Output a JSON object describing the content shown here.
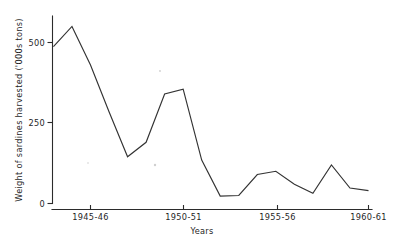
{
  "chart_data": {
    "type": "line",
    "title": "",
    "xlabel": "Years",
    "ylabel": "Weight of sardines harvested ('000s tons)",
    "xlim": [
      1943.0,
      1960.75
    ],
    "ylim": [
      0,
      580
    ],
    "yticks": [
      0,
      250,
      500
    ],
    "ytick_labels": [
      "0",
      "250",
      "500"
    ],
    "xticks": [
      1945,
      1950,
      1955,
      1960
    ],
    "xtick_labels": [
      "1945-46",
      "1950-51",
      "1955-56",
      "1960-61"
    ],
    "grid": false,
    "legend": false,
    "series": [
      {
        "name": "Weight of sardines harvested",
        "x": [
          1943.0,
          1944.0,
          1945.0,
          1946.0,
          1947.0,
          1948.0,
          1949.0,
          1950.0,
          1951.0,
          1952.0,
          1953.0,
          1954.0,
          1955.0,
          1956.0,
          1957.0,
          1958.0,
          1959.0,
          1960.0
        ],
        "values": [
          487,
          550,
          430,
          285,
          145,
          190,
          340,
          355,
          135,
          23,
          25,
          90,
          100,
          60,
          32,
          120,
          48,
          40
        ]
      }
    ]
  },
  "axis": {
    "y_label": "Weight of sardines harvested ('000s tons)",
    "x_label": "Years",
    "y_tick_0": "0",
    "y_tick_250": "250",
    "y_tick_500": "500",
    "x_tick_1945": "1945-46",
    "x_tick_1950": "1950-51",
    "x_tick_1955": "1955-56",
    "x_tick_1960": "1960-61"
  },
  "colors": {
    "line": "#333333",
    "axis": "#2b2b2b",
    "text": "#1f1f1f",
    "background": "#ffffff"
  }
}
